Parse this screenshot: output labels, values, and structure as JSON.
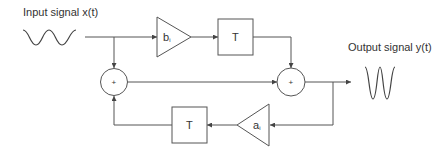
{
  "diagram": {
    "type": "IIR filter block diagram",
    "input_label": "Input signal x(t)",
    "output_label": "Output signal y(t)",
    "blocks": {
      "feedforward_gain": {
        "symbol": "b",
        "subscript": "i"
      },
      "feedforward_delay": {
        "symbol": "T"
      },
      "feedback_gain": {
        "symbol": "a",
        "subscript": "i"
      },
      "feedback_delay": {
        "symbol": "T"
      },
      "left_summer": {
        "symbol": "+"
      },
      "right_summer": {
        "symbol": "+"
      }
    },
    "colors": {
      "stroke": "#555555",
      "text": "#333333",
      "background": "#ffffff"
    }
  }
}
